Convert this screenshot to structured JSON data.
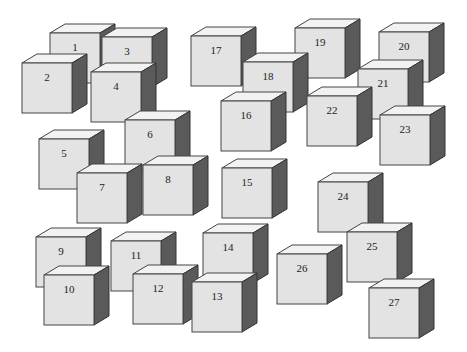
{
  "diagram": {
    "title": "",
    "style": {
      "front_color": "#e3e3e3",
      "top_color": "#f2f2f2",
      "side_color": "#5a5a5a",
      "edge_color": "#444444",
      "cube_size": 50,
      "depth_dx": 15,
      "depth_dy": 9
    },
    "cubes": [
      {
        "label": "1",
        "x": 50,
        "y": 33,
        "z": 1
      },
      {
        "label": "3",
        "x": 102,
        "y": 37,
        "z": 2
      },
      {
        "label": "2",
        "x": 22,
        "y": 63,
        "z": 3
      },
      {
        "label": "4",
        "x": 91,
        "y": 72,
        "z": 4
      },
      {
        "label": "17",
        "x": 191,
        "y": 36,
        "z": 1
      },
      {
        "label": "19",
        "x": 295,
        "y": 28,
        "z": 1
      },
      {
        "label": "20",
        "x": 379,
        "y": 32,
        "z": 1
      },
      {
        "label": "18",
        "x": 243,
        "y": 62,
        "z": 2
      },
      {
        "label": "21",
        "x": 358,
        "y": 69,
        "z": 2
      },
      {
        "label": "22",
        "x": 307,
        "y": 96,
        "z": 3
      },
      {
        "label": "16",
        "x": 221,
        "y": 101,
        "z": 3
      },
      {
        "label": "23",
        "x": 380,
        "y": 115,
        "z": 3
      },
      {
        "label": "6",
        "x": 125,
        "y": 120,
        "z": 2
      },
      {
        "label": "5",
        "x": 39,
        "y": 139,
        "z": 2
      },
      {
        "label": "8",
        "x": 143,
        "y": 165,
        "z": 3
      },
      {
        "label": "15",
        "x": 222,
        "y": 168,
        "z": 3
      },
      {
        "label": "7",
        "x": 77,
        "y": 173,
        "z": 3
      },
      {
        "label": "24",
        "x": 318,
        "y": 182,
        "z": 3
      },
      {
        "label": "25",
        "x": 347,
        "y": 232,
        "z": 4
      },
      {
        "label": "14",
        "x": 203,
        "y": 233,
        "z": 4
      },
      {
        "label": "9",
        "x": 36,
        "y": 237,
        "z": 4
      },
      {
        "label": "11",
        "x": 111,
        "y": 241,
        "z": 4
      },
      {
        "label": "26",
        "x": 277,
        "y": 254,
        "z": 4
      },
      {
        "label": "12",
        "x": 133,
        "y": 274,
        "z": 5
      },
      {
        "label": "10",
        "x": 44,
        "y": 275,
        "z": 5
      },
      {
        "label": "13",
        "x": 192,
        "y": 282,
        "z": 5
      },
      {
        "label": "27",
        "x": 369,
        "y": 288,
        "z": 5
      }
    ]
  }
}
